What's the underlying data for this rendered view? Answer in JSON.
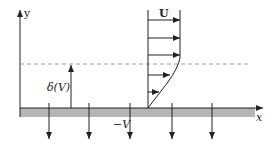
{
  "diagram": {
    "labels": {
      "y_axis": "y",
      "x_axis": "x",
      "free_stream": "U",
      "thickness": "δ(V)",
      "suction": "−V"
    },
    "colors": {
      "plate": "#b5b5b5",
      "line": "#222222",
      "dashed": "#9a9a9a"
    },
    "profile_arrows": [
      {
        "y": 20,
        "x_end": 180
      },
      {
        "y": 38,
        "x_end": 180
      },
      {
        "y": 55,
        "x_end": 180
      },
      {
        "y": 75,
        "x_end": 170
      },
      {
        "y": 92,
        "x_end": 159
      }
    ],
    "suction_arrows_x": [
      49,
      89,
      130,
      172,
      212
    ]
  }
}
